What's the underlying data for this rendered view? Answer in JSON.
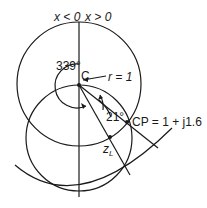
{
  "diagram": {
    "type": "smith-chart-construction",
    "labels": {
      "x_neg": "x < 0",
      "x_pos": "x > 0",
      "center": "C",
      "radius": "r = 1",
      "angle_outer": "339°",
      "angle_inner": "21°",
      "point_cp": "CP = 1 + j1.6",
      "load": "z",
      "load_sub": "L"
    },
    "colors": {
      "stroke": "#1a1a1a",
      "background": "#ffffff"
    }
  }
}
